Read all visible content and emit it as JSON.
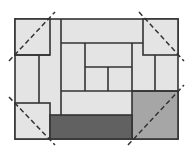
{
  "diagram": {
    "title": "",
    "colors": {
      "background": "#ffffff",
      "light_fill": "#e4e4e4",
      "medium_fill": "#a6a6a6",
      "dark_fill": "#616161",
      "stroke": "#333333",
      "dashed": "#333333"
    },
    "outer_rect": {
      "x": 15,
      "y": 19,
      "w": 163,
      "h": 120
    },
    "pieces": [
      {
        "name": "corner-square-top-left",
        "x": 15,
        "y": 19,
        "w": 35,
        "h": 36,
        "fill": "light"
      },
      {
        "name": "corner-square-top-right",
        "x": 143,
        "y": 19,
        "w": 35,
        "h": 36,
        "fill": "light"
      },
      {
        "name": "corner-square-bottom-left",
        "x": 15,
        "y": 103,
        "w": 35,
        "h": 36,
        "fill": "light"
      },
      {
        "name": "gray-square-bottom-right",
        "x": 132,
        "y": 91,
        "w": 46,
        "h": 48,
        "fill": "medium"
      },
      {
        "name": "dark-bar-bottom",
        "x": 50,
        "y": 115,
        "w": 82,
        "h": 24,
        "fill": "dark"
      }
    ],
    "lines": [
      {
        "x1": 61,
        "y1": 19,
        "x2": 61,
        "y2": 115
      },
      {
        "x1": 61,
        "y1": 43,
        "x2": 143,
        "y2": 43
      },
      {
        "x1": 132,
        "y1": 43,
        "x2": 132,
        "y2": 91
      },
      {
        "x1": 85,
        "y1": 43,
        "x2": 85,
        "y2": 91
      },
      {
        "x1": 85,
        "y1": 67,
        "x2": 132,
        "y2": 67
      },
      {
        "x1": 108,
        "y1": 67,
        "x2": 108,
        "y2": 91
      },
      {
        "x1": 61,
        "y1": 91,
        "x2": 178,
        "y2": 91
      },
      {
        "x1": 39,
        "y1": 55,
        "x2": 39,
        "y2": 103
      },
      {
        "x1": 15,
        "y1": 55,
        "x2": 50,
        "y2": 55
      },
      {
        "x1": 155,
        "y1": 55,
        "x2": 155,
        "y2": 91
      }
    ],
    "dashed_lines": [
      {
        "name": "diagonal-top-left",
        "x1": 9,
        "y1": 61,
        "x2": 55,
        "y2": 12
      },
      {
        "name": "diagonal-top-right",
        "x1": 139,
        "y1": 12,
        "x2": 184,
        "y2": 61
      },
      {
        "name": "diagonal-bottom-left",
        "x1": 9,
        "y1": 97,
        "x2": 55,
        "y2": 145
      },
      {
        "name": "diagonal-bottom-right",
        "x1": 128,
        "y1": 145,
        "x2": 184,
        "y2": 85
      }
    ]
  }
}
